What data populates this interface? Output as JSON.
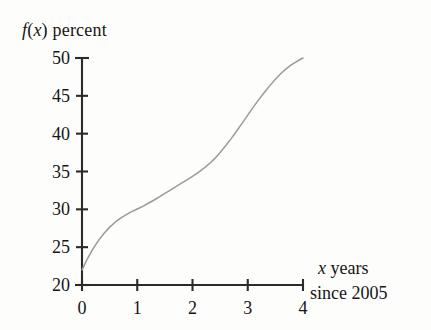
{
  "chart_data": {
    "type": "line",
    "title": "",
    "ylabel": "f(x) percent",
    "ylabel_parts": {
      "fn": "f",
      "paren_open": "(",
      "var": "x",
      "paren_close": ")",
      "word": "percent"
    },
    "xlabel": "x years since 2005",
    "xlabel_line1": "years",
    "xlabel_line1_var": "x",
    "xlabel_line2": "since 2005",
    "xlim": [
      0,
      4
    ],
    "ylim": [
      20,
      50
    ],
    "xticks": [
      0,
      1,
      2,
      3,
      4
    ],
    "xtick_labels": [
      "0",
      "1",
      "2",
      "3",
      "4"
    ],
    "yticks": [
      20,
      25,
      30,
      35,
      40,
      45,
      50
    ],
    "ytick_labels": [
      "20",
      "25",
      "30",
      "35",
      "40",
      "45",
      "50"
    ],
    "grid": false,
    "legend": false,
    "legend_position": "none",
    "series": [
      {
        "name": "f(x)",
        "color": "#9a9a9a",
        "x": [
          0.0,
          0.1,
          0.2,
          0.3,
          0.4,
          0.5,
          0.6,
          0.7,
          0.8,
          0.9,
          1.0,
          1.1,
          1.2,
          1.3,
          1.4,
          1.5,
          1.6,
          1.7,
          1.8,
          1.9,
          2.0,
          2.1,
          2.2,
          2.3,
          2.4,
          2.5,
          2.6,
          2.7,
          2.8,
          2.9,
          3.0,
          3.1,
          3.2,
          3.3,
          3.4,
          3.5,
          3.6,
          3.7,
          3.8,
          3.9,
          4.0
        ],
        "y": [
          22.0,
          23.5,
          24.8,
          25.9,
          26.85,
          27.65,
          28.3,
          28.85,
          29.3,
          29.7,
          30.05,
          30.4,
          30.8,
          31.2,
          31.65,
          32.1,
          32.55,
          33.0,
          33.45,
          33.9,
          34.35,
          34.85,
          35.4,
          36.0,
          36.7,
          37.5,
          38.4,
          39.35,
          40.35,
          41.4,
          42.45,
          43.5,
          44.5,
          45.45,
          46.35,
          47.2,
          47.95,
          48.6,
          49.15,
          49.6,
          50.0
        ]
      }
    ],
    "annotations": [],
    "axis_color": "#2b2b2b",
    "curve_color": "#9a9a9a",
    "background": "#fdfdfb"
  }
}
